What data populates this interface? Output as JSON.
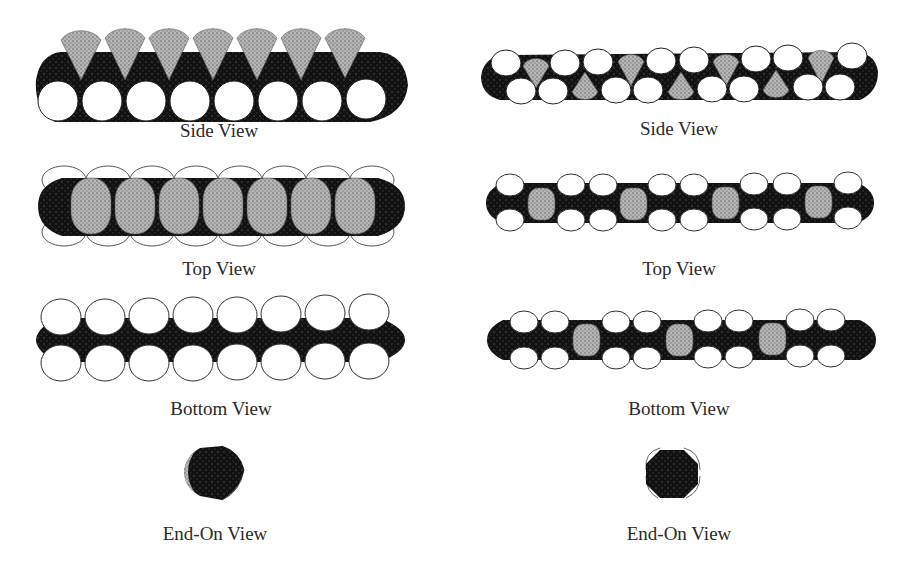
{
  "figure": {
    "colors": {
      "background": "#ffffff",
      "dark_body": "#141414",
      "stipple_fill": "#a8a8a8",
      "sphere_fill": "#ffffff",
      "sphere_stroke": "#3a3a3a",
      "label_text": "#2a2a2a"
    },
    "left_structure": {
      "side_view": {
        "label": "Side View",
        "white_spheres": 8,
        "stippled_cones": 7
      },
      "top_view": {
        "label": "Top View",
        "stippled_ovals": 7,
        "outline_spheres_per_side": 8
      },
      "bottom_view": {
        "label": "Bottom View",
        "white_spheres_top_row": 8,
        "white_spheres_bottom_row": 8
      },
      "end_on_view": {
        "label": "End-On View"
      }
    },
    "right_structure": {
      "side_view": {
        "label": "Side View",
        "white_spheres_top_row": 9,
        "white_spheres_bottom_row": 8,
        "stippled_cones_up": 4,
        "stippled_cones_down": 3
      },
      "top_view": {
        "label": "Top View",
        "stippled_ovals": 4,
        "white_spheres_per_row": 9
      },
      "bottom_view": {
        "label": "Bottom View",
        "stippled_ovals": 3,
        "white_spheres_per_row": 9
      },
      "end_on_view": {
        "label": "End-On View"
      }
    }
  }
}
